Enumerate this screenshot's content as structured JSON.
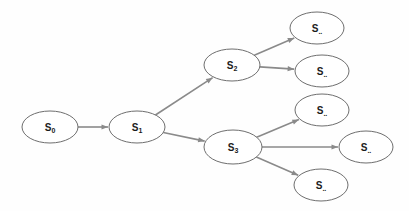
{
  "diagram": {
    "type": "tree",
    "background_color": "#fefefe",
    "node_fill": "#ffffff",
    "node_stroke": "#6e6e6e",
    "edge_color": "#8a8a8a",
    "label_color": "#1b1b1b",
    "nodes": [
      {
        "id": "s0",
        "base": "S",
        "sub": "0",
        "cx": 50,
        "cy": 127,
        "rx": 28,
        "ry": 16
      },
      {
        "id": "s1",
        "base": "S",
        "sub": "1",
        "cx": 137,
        "cy": 127,
        "rx": 28,
        "ry": 16
      },
      {
        "id": "s2",
        "base": "S",
        "sub": "2",
        "cx": 232,
        "cy": 65,
        "rx": 28,
        "ry": 16
      },
      {
        "id": "s3",
        "base": "S",
        "sub": "3",
        "cx": 233,
        "cy": 147,
        "rx": 29,
        "ry": 17
      },
      {
        "id": "leaf1",
        "base": "S",
        "sub": "..",
        "cx": 317,
        "cy": 28,
        "rx": 27,
        "ry": 16
      },
      {
        "id": "leaf2",
        "base": "S",
        "sub": "..",
        "cx": 322,
        "cy": 71,
        "rx": 27,
        "ry": 16
      },
      {
        "id": "leaf3",
        "base": "S",
        "sub": "..",
        "cx": 322,
        "cy": 110,
        "rx": 27,
        "ry": 16
      },
      {
        "id": "leaf4",
        "base": "S",
        "sub": "..",
        "cx": 366,
        "cy": 147,
        "rx": 27,
        "ry": 16
      },
      {
        "id": "leaf5",
        "base": "S",
        "sub": "..",
        "cx": 321,
        "cy": 185,
        "rx": 27,
        "ry": 16
      }
    ],
    "edges": [
      {
        "from": "s0",
        "to": "s1",
        "arrow": true
      },
      {
        "from": "s1",
        "to": "s2",
        "arrow": true
      },
      {
        "from": "s1",
        "to": "s3",
        "arrow": true
      },
      {
        "from": "s2",
        "to": "leaf1",
        "arrow": true
      },
      {
        "from": "s2",
        "to": "leaf2",
        "arrow": true
      },
      {
        "from": "s3",
        "to": "leaf3",
        "arrow": true
      },
      {
        "from": "s3",
        "to": "leaf4",
        "arrow": true
      },
      {
        "from": "s3",
        "to": "leaf5",
        "arrow": true
      }
    ]
  }
}
